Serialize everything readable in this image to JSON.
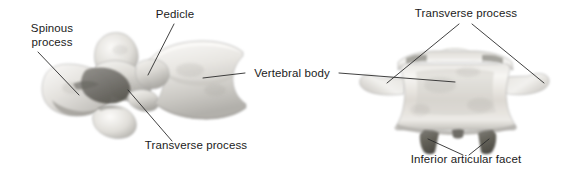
{
  "figure": {
    "background_color": "#ffffff",
    "label_color": "#1b1b1b",
    "leader_line_color": "#2b2b2b",
    "bone_light_color": "#f2f1ee",
    "bone_mid_color": "#cfcdc8",
    "bone_shadow_color": "#7d7b76",
    "bone_dark_color": "#5d5b57"
  },
  "left_view": {
    "name": "lateral-oblique-view",
    "labels": [
      {
        "id": "spinous-process",
        "lines": [
          "Spinous",
          "process"
        ],
        "text": "Spinous process",
        "x": 52,
        "y_first_line": 32,
        "y_second_line": 46,
        "anchor": "middle"
      },
      {
        "id": "pedicle",
        "lines": [
          "Pedicle"
        ],
        "text": "Pedicle",
        "x": 175,
        "y_first_line": 18,
        "anchor": "middle"
      },
      {
        "id": "transverse-process",
        "lines": [
          "Transverse process"
        ],
        "text": "Transverse process",
        "x": 196,
        "y_first_line": 149,
        "anchor": "middle"
      }
    ]
  },
  "center_label": {
    "id": "vertebral-body",
    "text": "Vertebral body",
    "x": 292,
    "y": 77,
    "anchor": "middle"
  },
  "right_view": {
    "name": "posterior-view",
    "labels": [
      {
        "id": "transverse-process-right",
        "lines": [
          "Transverse process"
        ],
        "text": "Transverse process",
        "x": 466,
        "y_first_line": 17,
        "anchor": "middle"
      },
      {
        "id": "inferior-articular-facet",
        "lines": [
          "Inferior articular facet"
        ],
        "text": "Inferior articular facet",
        "x": 466,
        "y_first_line": 163,
        "anchor": "middle"
      }
    ]
  }
}
